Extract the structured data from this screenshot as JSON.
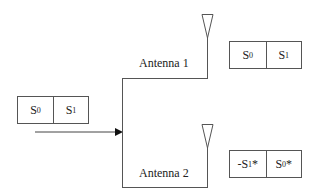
{
  "input_block": {
    "symbols": [
      {
        "base": "S",
        "sub": "0",
        "suffix": "",
        "prefix": ""
      },
      {
        "base": "S",
        "sub": "1",
        "suffix": "",
        "prefix": ""
      }
    ]
  },
  "antennas": [
    {
      "label": "Antenna 1",
      "symbols": [
        {
          "prefix": "",
          "base": "S",
          "sub": "0",
          "suffix": ""
        },
        {
          "prefix": "",
          "base": "S",
          "sub": "1",
          "suffix": ""
        }
      ]
    },
    {
      "label": "Antenna 2",
      "symbols": [
        {
          "prefix": "-",
          "base": "S",
          "sub": "1",
          "suffix": "*"
        },
        {
          "prefix": "",
          "base": "S",
          "sub": "0",
          "suffix": "*"
        }
      ]
    }
  ],
  "colors": {
    "line": "#555555",
    "text": "#222222"
  }
}
